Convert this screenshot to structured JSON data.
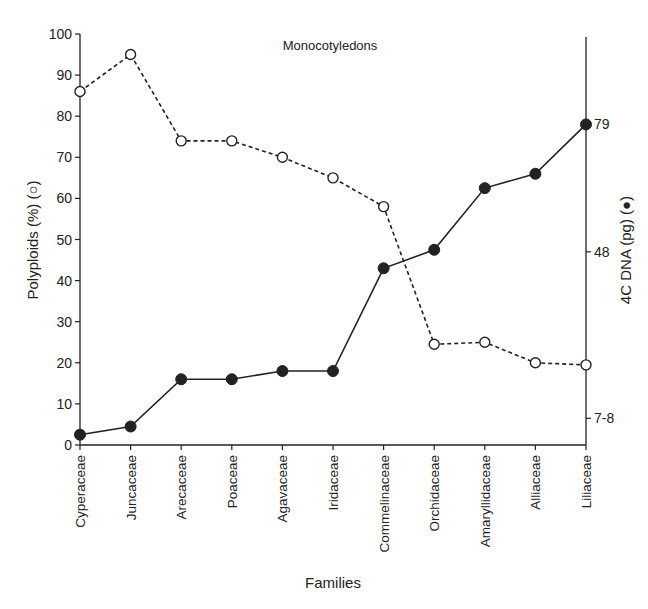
{
  "chart_data": {
    "type": "line",
    "title": "Monocotyledons",
    "xlabel": "Families",
    "ylabel": "Polyploids (%) (○)",
    "ylabel_right": "4C DNA (pg) (●)",
    "categories": [
      "Cyperaceae",
      "Juncaceae",
      "Arecaceae",
      "Poaceae",
      "Agavaceae",
      "Iridaceae",
      "Commelinaceae",
      "Orchidaceae",
      "Amaryllidaceae",
      "Alliaceae",
      "Liliaceae"
    ],
    "ylim": [
      0,
      100
    ],
    "yticks": [
      0,
      10,
      20,
      30,
      40,
      50,
      60,
      70,
      80,
      90,
      100
    ],
    "right_axis_ticks": [
      {
        "label": "79",
        "left_equiv": 78
      },
      {
        "label": "48",
        "left_equiv": 47
      },
      {
        "label": "7-8",
        "left_equiv": 6.5
      }
    ],
    "grid": false,
    "legend": "none (markers described in axis labels)",
    "series": [
      {
        "name": "Polyploids (%)",
        "marker": "open-circle",
        "line": "dashed",
        "axis": "left",
        "values": [
          86,
          95,
          74,
          74,
          70,
          65,
          58,
          24.5,
          25,
          20,
          19.5
        ]
      },
      {
        "name": "4C DNA (pg)",
        "marker": "filled-circle",
        "line": "solid",
        "axis": "right",
        "values": [
          2.5,
          4.5,
          16,
          16,
          18,
          18,
          43,
          47.5,
          62.5,
          66,
          78
        ]
      }
    ]
  },
  "colors": {
    "ink": "#222222",
    "background": "#ffffff"
  }
}
